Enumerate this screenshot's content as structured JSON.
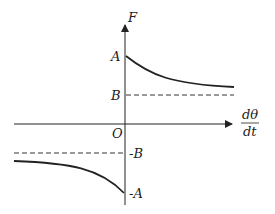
{
  "diagram": {
    "y_axis_label": "F",
    "x_axis_label_num": "dθ",
    "x_axis_label_den": "dt",
    "origin_label": "O",
    "ticks": {
      "A": "A",
      "B": "B",
      "neg_B": "-B",
      "neg_A": "-A"
    },
    "curves": [
      {
        "name": "positive-branch",
        "description": "decreasing from A toward asymptote B for dθ/dt > 0"
      },
      {
        "name": "negative-branch",
        "description": "decreasing toward -A as dθ/dt approaches 0 from the left, asymptote -B"
      }
    ],
    "colors": {
      "line": "#222222",
      "background": "#ffffff"
    }
  }
}
